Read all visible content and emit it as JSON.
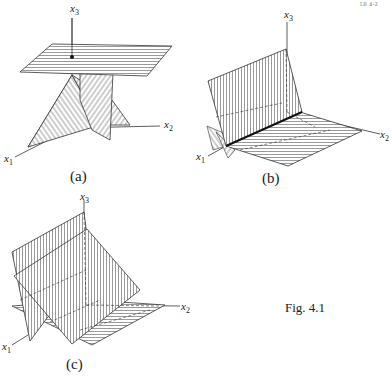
{
  "header_fragment": "ᴸᴮ ⁴ˑ²",
  "figure_caption": "Fig. 4.1",
  "panels": [
    {
      "id": "a",
      "caption": "(a)",
      "axes": {
        "x1": "x",
        "x1_sub": "1",
        "x2": "x",
        "x2_sub": "2",
        "x3": "x",
        "x3_sub": "3"
      }
    },
    {
      "id": "b",
      "caption": "(b)",
      "axes": {
        "x1": "x",
        "x1_sub": "1",
        "x2": "x",
        "x2_sub": "2",
        "x3": "x",
        "x3_sub": "3"
      }
    },
    {
      "id": "c",
      "caption": "(c)",
      "axes": {
        "x1": "x",
        "x1_sub": "1",
        "x2": "x",
        "x2_sub": "2",
        "x3": "x",
        "x3_sub": "3"
      }
    }
  ]
}
